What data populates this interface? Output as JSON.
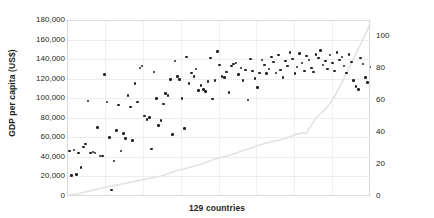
{
  "chart_data": {
    "type": "scatter",
    "title": "",
    "xlabel": "129 countries",
    "ylabel": "GDP per capita (US$)",
    "y2label": "Female secondary school enrollment",
    "ylim": [
      0,
      180000
    ],
    "y2lim": [
      0,
      110
    ],
    "xlim": [
      0,
      129
    ],
    "grid": true,
    "legend": "none",
    "y_ticks": [
      "0",
      "20,000",
      "40,000",
      "60,000",
      "80,000",
      "100,000",
      "120,000",
      "140,000",
      "160,000",
      "180,000"
    ],
    "y_tick_values": [
      0,
      20000,
      40000,
      60000,
      80000,
      100000,
      120000,
      140000,
      160000,
      180000
    ],
    "y2_ticks": [
      "0",
      "20",
      "40",
      "60",
      "80",
      "100"
    ],
    "y2_tick_values": [
      0,
      20,
      40,
      60,
      80,
      100
    ],
    "colors": {
      "scatter": "#231f20",
      "line": "#e2e2e2",
      "grid": "#ededed",
      "frame": "#d9d9d9"
    },
    "series": [
      {
        "name": "GDP per capita (US$)",
        "axis": "left",
        "mark": "scatter",
        "x": [
          1,
          2,
          3,
          4,
          5,
          6,
          7,
          8,
          9,
          10,
          11,
          12,
          13,
          14,
          15,
          16,
          17,
          18,
          19,
          20,
          21,
          22,
          23,
          24,
          25,
          26,
          27,
          28,
          29,
          30,
          31,
          32,
          33,
          34,
          35,
          36,
          37,
          38,
          39,
          40,
          41,
          42,
          43,
          44,
          45,
          46,
          47,
          48,
          49,
          50,
          51,
          52,
          53,
          54,
          55,
          56,
          57,
          58,
          59,
          60,
          61,
          62,
          63,
          64,
          65,
          66,
          67,
          68,
          69,
          70,
          71,
          72,
          73,
          74,
          75,
          76,
          77,
          78,
          79,
          80,
          81,
          82,
          83,
          84,
          85,
          86,
          87,
          88,
          89,
          90,
          91,
          92,
          93,
          94,
          95,
          96,
          97,
          98,
          99,
          100,
          101,
          102,
          103,
          104,
          105,
          106,
          107,
          108,
          109,
          110,
          111,
          112,
          113,
          114,
          115,
          116,
          117,
          118,
          119,
          120,
          121,
          122,
          123,
          124,
          125,
          126,
          127,
          128,
          129
        ],
        "values": [
          46000,
          21000,
          47000,
          22000,
          44000,
          29000,
          50000,
          53000,
          97000,
          44000,
          45000,
          44000,
          70000,
          41000,
          41000,
          124000,
          96000,
          60000,
          6000,
          36000,
          67000,
          93000,
          46000,
          64000,
          59000,
          103000,
          91000,
          57000,
          115000,
          96000,
          131000,
          133000,
          82000,
          78000,
          80000,
          48000,
          127000,
          100000,
          72000,
          77000,
          94000,
          105000,
          103000,
          119000,
          63000,
          138000,
          122000,
          119000,
          100000,
          69000,
          142000,
          115000,
          126000,
          122000,
          130000,
          108000,
          113000,
          109000,
          107000,
          117000,
          141000,
          99000,
          118000,
          148000,
          134000,
          122000,
          121000,
          127000,
          106000,
          133000,
          135000,
          136000,
          124000,
          131000,
          118000,
          129000,
          98000,
          140000,
          128000,
          120000,
          111000,
          126000,
          139000,
          134000,
          125000,
          130000,
          142000,
          137000,
          126000,
          144000,
          129000,
          121000,
          138000,
          133000,
          147000,
          140000,
          125000,
          132000,
          146000,
          136000,
          128000,
          143000,
          139000,
          131000,
          127000,
          145000,
          141000,
          149000,
          134000,
          138000,
          130000,
          144000,
          136000,
          128000,
          147000,
          139000,
          142000,
          133000,
          126000,
          145000,
          137000,
          118000,
          112000,
          109000,
          141000,
          135000,
          121000,
          116000,
          132000
        ]
      },
      {
        "name": "Female secondary school enrollment",
        "axis": "right",
        "mark": "line",
        "x": [
          1,
          2,
          3,
          4,
          5,
          6,
          7,
          8,
          9,
          10,
          11,
          12,
          13,
          14,
          15,
          16,
          17,
          18,
          19,
          20,
          21,
          22,
          23,
          24,
          25,
          26,
          27,
          28,
          29,
          30,
          31,
          32,
          33,
          34,
          35,
          36,
          37,
          38,
          39,
          40,
          41,
          42,
          43,
          44,
          45,
          46,
          47,
          48,
          49,
          50,
          51,
          52,
          53,
          54,
          55,
          56,
          57,
          58,
          59,
          60,
          61,
          62,
          63,
          64,
          65,
          66,
          67,
          68,
          69,
          70,
          71,
          72,
          73,
          74,
          75,
          76,
          77,
          78,
          79,
          80,
          81,
          82,
          83,
          84,
          85,
          86,
          87,
          88,
          89,
          90,
          91,
          92,
          93,
          94,
          95,
          96,
          97,
          98,
          99,
          100,
          101,
          102,
          103,
          104,
          105,
          106,
          107,
          108,
          109,
          110,
          111,
          112,
          113,
          114,
          115,
          116,
          117,
          118,
          119,
          120,
          121,
          122,
          123,
          124,
          125,
          126,
          127,
          128,
          129
        ],
        "values": [
          0.4,
          0.7,
          1.0,
          1.3,
          1.6,
          1.9,
          2.2,
          2.6,
          2.9,
          3.3,
          3.6,
          4.0,
          4.3,
          4.6,
          5.0,
          5.3,
          5.6,
          5.9,
          6.2,
          6.5,
          6.8,
          7.1,
          7.4,
          7.7,
          8.0,
          8.3,
          8.6,
          8.9,
          9.2,
          9.5,
          9.8,
          10.1,
          10.4,
          10.7,
          11.0,
          11.3,
          11.6,
          11.9,
          12.2,
          12.5,
          12.9,
          13.4,
          13.9,
          14.4,
          14.9,
          15.4,
          15.9,
          16.3,
          16.7,
          17.0,
          17.4,
          17.8,
          18.2,
          18.6,
          19.0,
          19.4,
          19.8,
          20.3,
          20.9,
          21.5,
          22.1,
          22.7,
          23.1,
          23.5,
          23.9,
          24.2,
          24.6,
          25.0,
          25.4,
          25.9,
          26.4,
          26.9,
          27.4,
          27.9,
          28.4,
          28.9,
          29.4,
          29.9,
          30.4,
          30.9,
          31.4,
          31.9,
          32.3,
          32.7,
          33.1,
          33.5,
          33.9,
          34.3,
          34.6,
          34.9,
          35.2,
          35.6,
          36.0,
          36.5,
          37.0,
          37.6,
          38.2,
          38.7,
          39.0,
          39.2,
          39.4,
          38.8,
          42.0,
          44.0,
          46.5,
          48.5,
          50.0,
          51.5,
          53.0,
          54.5,
          56.0,
          58.0,
          60.0,
          62.5,
          65.0,
          68.0,
          71.0,
          74.0,
          77.0,
          80.0,
          83.0,
          86.0,
          89.0,
          92.0,
          95.0,
          98.0,
          101.0,
          104.0,
          107.0
        ]
      }
    ]
  }
}
